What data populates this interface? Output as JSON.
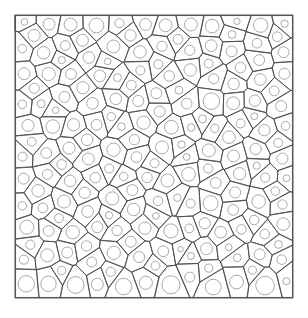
{
  "figure": {
    "type": "voronoi-diagram",
    "canvas": {
      "width": 308,
      "height": 318,
      "background": "#ffffff"
    },
    "frame": {
      "x": 15,
      "y": 15,
      "width": 278,
      "height": 283,
      "stroke": "#555555",
      "stroke_width": 1.1,
      "fill": "none"
    },
    "style": {
      "edge_color": "#4a4a4a",
      "edge_width": 0.85,
      "circle_color": "#9a9a9a",
      "circle_width": 0.85,
      "circle_fill": "none",
      "circle_inset": 3.1,
      "min_circle_radius": 2.2
    },
    "seed_count": 196,
    "seeds": [
      [
        23,
        24
      ],
      [
        47,
        22
      ],
      [
        72,
        27
      ],
      [
        97,
        21
      ],
      [
        120,
        26
      ],
      [
        143,
        20
      ],
      [
        166,
        27
      ],
      [
        190,
        22
      ],
      [
        214,
        27
      ],
      [
        238,
        21
      ],
      [
        262,
        26
      ],
      [
        285,
        22
      ],
      [
        20,
        48
      ],
      [
        44,
        52
      ],
      [
        68,
        45
      ],
      [
        92,
        54
      ],
      [
        115,
        46
      ],
      [
        139,
        53
      ],
      [
        162,
        45
      ],
      [
        187,
        52
      ],
      [
        210,
        46
      ],
      [
        234,
        53
      ],
      [
        258,
        46
      ],
      [
        283,
        52
      ],
      [
        24,
        74
      ],
      [
        49,
        70
      ],
      [
        73,
        78
      ],
      [
        98,
        71
      ],
      [
        121,
        79
      ],
      [
        145,
        70
      ],
      [
        169,
        77
      ],
      [
        193,
        70
      ],
      [
        216,
        78
      ],
      [
        241,
        71
      ],
      [
        264,
        78
      ],
      [
        287,
        71
      ],
      [
        19,
        99
      ],
      [
        43,
        104
      ],
      [
        67,
        97
      ],
      [
        91,
        105
      ],
      [
        114,
        98
      ],
      [
        138,
        105
      ],
      [
        161,
        97
      ],
      [
        186,
        104
      ],
      [
        209,
        98
      ],
      [
        233,
        105
      ],
      [
        257,
        98
      ],
      [
        282,
        104
      ],
      [
        25,
        126
      ],
      [
        50,
        121
      ],
      [
        74,
        129
      ],
      [
        99,
        122
      ],
      [
        122,
        130
      ],
      [
        146,
        121
      ],
      [
        170,
        128
      ],
      [
        194,
        121
      ],
      [
        217,
        129
      ],
      [
        242,
        122
      ],
      [
        265,
        129
      ],
      [
        288,
        122
      ],
      [
        20,
        151
      ],
      [
        44,
        156
      ],
      [
        68,
        149
      ],
      [
        92,
        157
      ],
      [
        115,
        150
      ],
      [
        139,
        157
      ],
      [
        162,
        149
      ],
      [
        187,
        156
      ],
      [
        210,
        150
      ],
      [
        234,
        157
      ],
      [
        258,
        150
      ],
      [
        283,
        156
      ],
      [
        24,
        177
      ],
      [
        49,
        172
      ],
      [
        73,
        180
      ],
      [
        98,
        173
      ],
      [
        121,
        181
      ],
      [
        145,
        172
      ],
      [
        169,
        179
      ],
      [
        193,
        172
      ],
      [
        216,
        180
      ],
      [
        241,
        173
      ],
      [
        264,
        180
      ],
      [
        287,
        173
      ],
      [
        19,
        202
      ],
      [
        43,
        207
      ],
      [
        67,
        200
      ],
      [
        91,
        208
      ],
      [
        114,
        201
      ],
      [
        138,
        208
      ],
      [
        161,
        200
      ],
      [
        186,
        207
      ],
      [
        209,
        201
      ],
      [
        233,
        208
      ],
      [
        257,
        201
      ],
      [
        282,
        207
      ],
      [
        25,
        229
      ],
      [
        50,
        224
      ],
      [
        74,
        232
      ],
      [
        99,
        225
      ],
      [
        122,
        233
      ],
      [
        146,
        224
      ],
      [
        170,
        231
      ],
      [
        194,
        224
      ],
      [
        217,
        232
      ],
      [
        242,
        225
      ],
      [
        265,
        232
      ],
      [
        288,
        225
      ],
      [
        20,
        254
      ],
      [
        44,
        259
      ],
      [
        68,
        252
      ],
      [
        92,
        260
      ],
      [
        115,
        253
      ],
      [
        139,
        260
      ],
      [
        162,
        252
      ],
      [
        187,
        259
      ],
      [
        210,
        253
      ],
      [
        234,
        260
      ],
      [
        258,
        253
      ],
      [
        283,
        259
      ],
      [
        24,
        280
      ],
      [
        49,
        275
      ],
      [
        73,
        283
      ],
      [
        98,
        276
      ],
      [
        121,
        284
      ],
      [
        145,
        275
      ],
      [
        169,
        282
      ],
      [
        193,
        275
      ],
      [
        216,
        283
      ],
      [
        241,
        276
      ],
      [
        264,
        283
      ],
      [
        287,
        276
      ],
      [
        33,
        36
      ],
      [
        82,
        38
      ],
      [
        131,
        34
      ],
      [
        180,
        39
      ],
      [
        229,
        35
      ],
      [
        277,
        38
      ],
      [
        33,
        88
      ],
      [
        82,
        90
      ],
      [
        131,
        86
      ],
      [
        180,
        91
      ],
      [
        229,
        87
      ],
      [
        277,
        90
      ],
      [
        33,
        140
      ],
      [
        82,
        142
      ],
      [
        131,
        138
      ],
      [
        180,
        143
      ],
      [
        229,
        139
      ],
      [
        277,
        142
      ],
      [
        33,
        192
      ],
      [
        82,
        194
      ],
      [
        131,
        190
      ],
      [
        180,
        195
      ],
      [
        229,
        191
      ],
      [
        277,
        194
      ],
      [
        33,
        244
      ],
      [
        82,
        246
      ],
      [
        131,
        242
      ],
      [
        180,
        247
      ],
      [
        229,
        243
      ],
      [
        277,
        246
      ],
      [
        57,
        62
      ],
      [
        106,
        64
      ],
      [
        155,
        60
      ],
      [
        204,
        65
      ],
      [
        253,
        61
      ],
      [
        57,
        114
      ],
      [
        106,
        116
      ],
      [
        155,
        112
      ],
      [
        204,
        117
      ],
      [
        253,
        113
      ],
      [
        57,
        166
      ],
      [
        106,
        168
      ],
      [
        155,
        164
      ],
      [
        204,
        169
      ],
      [
        253,
        165
      ],
      [
        57,
        218
      ],
      [
        106,
        220
      ],
      [
        155,
        216
      ],
      [
        204,
        221
      ],
      [
        253,
        217
      ],
      [
        57,
        270
      ],
      [
        106,
        272
      ],
      [
        155,
        268
      ],
      [
        204,
        273
      ],
      [
        253,
        269
      ]
    ]
  }
}
